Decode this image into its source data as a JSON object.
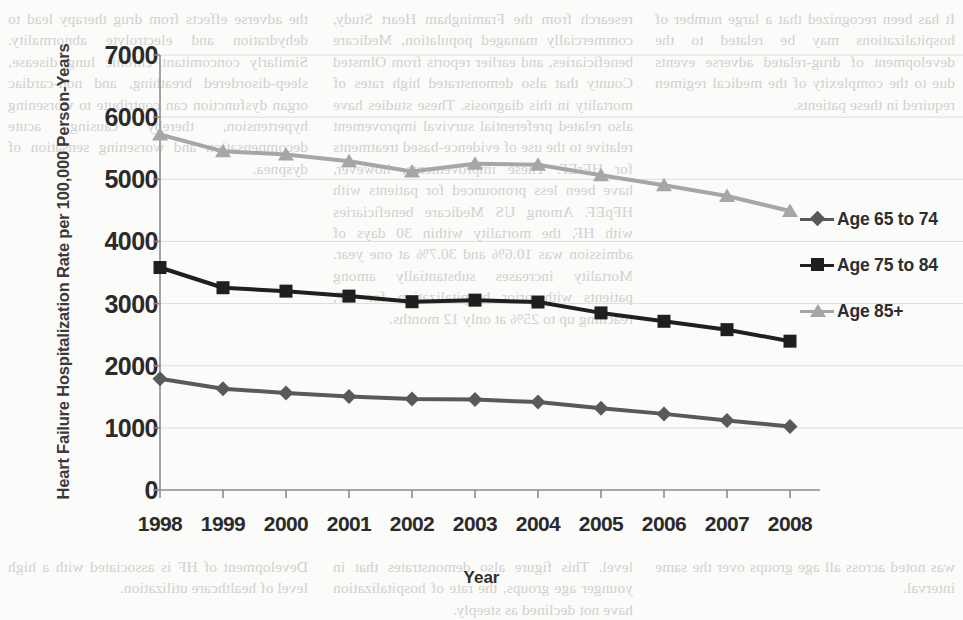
{
  "chart_data": {
    "type": "line",
    "title": "",
    "xlabel": "Year",
    "ylabel": "Heart Failure Hospitalization Rate per 100,000 Person-Years",
    "categories": [
      "1998",
      "1999",
      "2000",
      "2001",
      "2002",
      "2003",
      "2004",
      "2005",
      "2006",
      "2007",
      "2008"
    ],
    "x": [
      1998,
      1999,
      2000,
      2001,
      2002,
      2003,
      2004,
      2005,
      2006,
      2007,
      2008
    ],
    "ylim": [
      0,
      7000
    ],
    "yticks": [
      0,
      1000,
      2000,
      3000,
      4000,
      5000,
      6000,
      7000
    ],
    "grid": "horizontal",
    "legend_position": "right",
    "series": [
      {
        "name": "Age 65 to 74",
        "marker": "diamond",
        "color": "#595959",
        "values": [
          1790,
          1630,
          1560,
          1505,
          1465,
          1455,
          1415,
          1315,
          1225,
          1120,
          1020
        ]
      },
      {
        "name": "Age 75 to 84",
        "marker": "square",
        "color": "#1f1f1f",
        "values": [
          3580,
          3255,
          3200,
          3120,
          3030,
          3055,
          3025,
          2850,
          2715,
          2580,
          2395
        ]
      },
      {
        "name": "Age 85+",
        "marker": "triangle",
        "color": "#a6a6a6",
        "values": [
          5720,
          5450,
          5400,
          5290,
          5125,
          5250,
          5235,
          5065,
          4905,
          4730,
          4490
        ]
      }
    ]
  },
  "legend": {
    "items": [
      {
        "label": "Age 65 to 74"
      },
      {
        "label": "Age 75 to 84"
      },
      {
        "label": "Age 85+"
      }
    ]
  },
  "page_bleed": {
    "col_left": "the adverse effects from drug therapy lead to dehydration and electrolyte abnormality. Similarly concomitant chronic lung disease, sleep-disordered breathing, and non-cardiac organ dysfunction can contribute to worsening hypertension, thereby causing acute decompensation and worsening sensation of dyspnea.",
    "col_mid": "research from the Framingham Heart Study, commercially managed population, Medicare beneficiaries, and earlier reports from Olmsted County that also demonstrated high rates of mortality in this diagnosis. These studies have also related preferential survival improvement relative to the use of evidence-based treatments for HFrEF. These improvements, however, have been less pronounced for patients with HFpEF. Among US Medicare beneficiaries with HF, the mortality within 30 days of admission was 10.6% and 30.7% at one year. Mortality increases substantially among patients with prior hospitalization for HF, reaching up to 25% at only 12 months.",
    "col_right": "It has been recognized that a large number of hospitalizations may be related to the development of drug-related adverse events due to the complexity of the medical regimen required in these patients.",
    "bot_left": "Development of HF is associated with a high level of healthcare utilization.",
    "bot_mid": "level. This figure also demonstrates that in younger age groups, the rate of hospitalization have not declined as steeply.",
    "bot_right": "was noted across all age groups over the same interval."
  }
}
